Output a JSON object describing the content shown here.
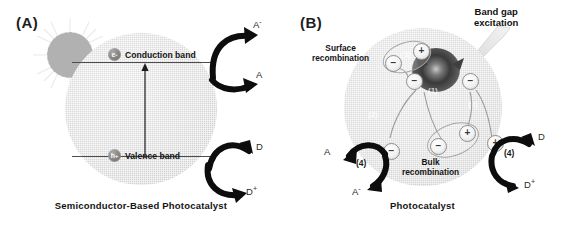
{
  "figure": {
    "panels": [
      {
        "id": "A",
        "label": "(A)",
        "caption": "Semiconductor-Based  Photocatalyst",
        "bands": {
          "conduction": {
            "label": "Conduction band",
            "carrier": "e",
            "carrier_charge": "-"
          },
          "valence": {
            "label": "Valence band",
            "carrier": "h",
            "carrier_charge": "+"
          }
        },
        "reagents": {
          "acceptor_product": "A",
          "acceptor_product_sup": "-",
          "acceptor": "A",
          "donor": "D",
          "donor_product": "D",
          "donor_product_sup": "+"
        },
        "icons": {
          "sun": "sun-icon",
          "light_beam": "light-beam-icon",
          "band_gap_arrow": "band-gap-arrow-icon"
        }
      },
      {
        "id": "B",
        "label": "(B)",
        "caption": "Photocatalyst",
        "annotations": {
          "band_gap_excitation_line1": "Band gap",
          "band_gap_excitation_line2": "excitation",
          "surface_recombination_line1": "Surface",
          "surface_recombination_line2": "recombination",
          "bulk_recombination_line1": "Bulk",
          "bulk_recombination_line2": "recombination"
        },
        "steps": [
          {
            "num": "(1)",
            "meaning": "band gap excitation"
          },
          {
            "num": "(2)",
            "meaning": "charge migration"
          },
          {
            "num": "(3)",
            "meaning": "surface recombination"
          },
          {
            "num": "(4)",
            "meaning": "interfacial charge transfer"
          }
        ],
        "step_markers": {
          "left_transfer": "(4)",
          "right_transfer": "(4)",
          "excitation": "(1)",
          "surface": "(3)",
          "migration_left": "(2)",
          "migration_right": "(2)",
          "bulk": "(3)"
        },
        "reagents": {
          "acceptor": "A",
          "acceptor_product": "A",
          "acceptor_product_sup": "-",
          "donor": "D",
          "donor_product": "D",
          "donor_product_sup": "+"
        },
        "charges": {
          "electron": "−",
          "hole": "+"
        }
      }
    ]
  },
  "colors": {
    "sphere_fill": "#d8d8d8",
    "band_line": "#4d4d4d",
    "arrow": "#0d0d0d",
    "text": "#141414",
    "excitation_core": "#3a3a3a"
  }
}
